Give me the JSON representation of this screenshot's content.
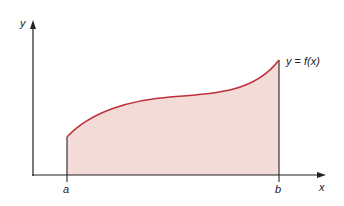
{
  "diagram": {
    "labels": {
      "y_axis": "y",
      "x_axis": "x",
      "lower_bound": "a",
      "upper_bound": "b",
      "function_prefix": "y = ",
      "function_name": "f",
      "function_arg": "(x)"
    },
    "colors": {
      "curve": "#c0303a",
      "region_fill": "#f3dcd8",
      "axes": "#222222"
    }
  }
}
